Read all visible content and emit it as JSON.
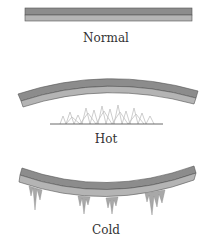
{
  "diagram": {
    "panels": [
      {
        "label": "Normal",
        "shape": "straight"
      },
      {
        "label": "Hot",
        "shape": "bends-up",
        "heat_source": "flames"
      },
      {
        "label": "Cold",
        "shape": "bends-down",
        "cold_source": "icicles"
      }
    ],
    "colors": {
      "metal_top": "#8c8c8c",
      "metal_bottom": "#b4b4b4",
      "outline": "#555555",
      "flame": "#c8c8c8",
      "icicle": "#a0a0a0",
      "text": "#333333"
    }
  }
}
